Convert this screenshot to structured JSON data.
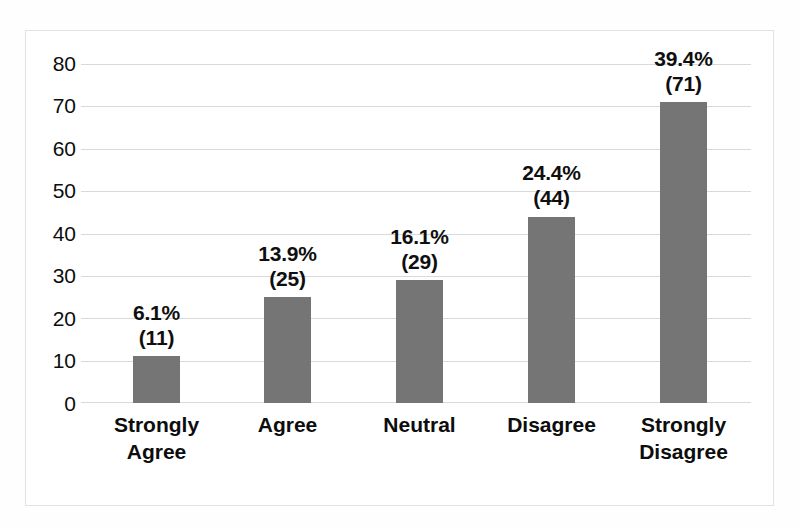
{
  "chart_data": {
    "type": "bar",
    "title": "",
    "subtitle": "",
    "xlabel": "",
    "ylabel": "",
    "categories": [
      "Strongly Agree",
      "Agree",
      "Neutral",
      "Disagree",
      "Strongly Disagree"
    ],
    "category_lines": [
      [
        "Strongly",
        "Agree"
      ],
      [
        "Agree"
      ],
      [
        "Neutral"
      ],
      [
        "Disagree"
      ],
      [
        "Strongly",
        "Disagree"
      ]
    ],
    "values": [
      11,
      25,
      29,
      44,
      71
    ],
    "percent_labels": [
      "6.1%",
      "13.9%",
      "16.1%",
      "24.4%",
      "39.4%"
    ],
    "count_labels": [
      "(11)",
      "(25)",
      "(29)",
      "(44)",
      "(71)"
    ],
    "data_labels": [
      "6.1%\n(11)",
      "13.9%\n(25)",
      "16.1%\n(29)",
      "24.4%\n(44)",
      "39.4%\n(71)"
    ],
    "ylim": [
      0,
      80
    ],
    "ytick_values": [
      80,
      70,
      60,
      50,
      40,
      30,
      20,
      10,
      0
    ],
    "ytick_labels": [
      "80",
      "70",
      "60",
      "50",
      "40",
      "30",
      "20",
      "10",
      "0"
    ],
    "grid": true,
    "legend": null,
    "legend_position": "none",
    "bar_color": "#757575",
    "gridline_color": "#d9d9d9",
    "plot_border_color": "#e2e2e2",
    "background_color": "#ffffff",
    "text_color": "#0d0d0d"
  }
}
